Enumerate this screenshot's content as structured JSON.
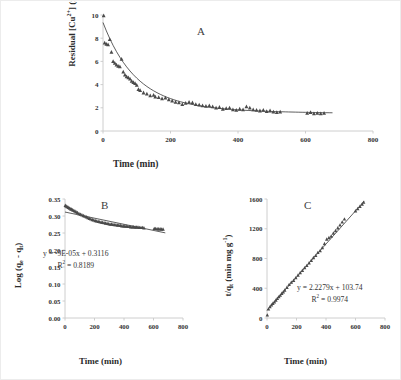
{
  "figure": {
    "background": "#ffffff",
    "axis_color": "#c8c8c8",
    "tick_label_color": "#333333",
    "marker_color": "#4a4a4a",
    "trend_color": "#1a1a1a"
  },
  "panels": [
    {
      "id": "A",
      "letter": "A",
      "xlabel": "Time (min)",
      "ylabel_parts": {
        "pre": "Residual [Cu",
        "sup1": "2+",
        "mid": "] (mg L",
        "sup2": "-1",
        "post": ")"
      },
      "ylabel_plain": "Residual [Cu2+] (mg L-1)",
      "xticks": [
        "0",
        "200",
        "400",
        "600",
        "800"
      ],
      "yticks": [
        "0",
        "2",
        "4",
        "6",
        "8",
        "10"
      ]
    },
    {
      "id": "B",
      "letter": "B",
      "xlabel": "Time (min)",
      "ylabel_parts": {
        "pre": "Log (q",
        "sub1": "e",
        "mid": " - q",
        "sub2": "t",
        "post": ")"
      },
      "ylabel_plain": "Log (qe - qt)",
      "xticks": [
        "0",
        "200",
        "400",
        "600",
        "800"
      ],
      "yticks": [
        "0.00",
        "0.05",
        "0.10",
        "0.15",
        "0.20",
        "0.25",
        "0.30",
        "0.35"
      ],
      "equation": "y = -9E-05x + 0.3116",
      "r_squared_pre": "R",
      "r_squared_sup": "2",
      "r_squared_post": " = 0.8189"
    },
    {
      "id": "C",
      "letter": "C",
      "xlabel": "Time (min)",
      "ylabel_parts": {
        "pre": "t/q",
        "sub1": "t",
        "mid": " (min mg g",
        "sup2": "-1",
        "post": ")"
      },
      "ylabel_plain": "t/qt (min mg g-1)",
      "xticks": [
        "0",
        "200",
        "400",
        "600",
        "800"
      ],
      "yticks": [
        "0",
        "400",
        "800",
        "1200",
        "1600"
      ],
      "equation": "y = 2.2279x + 103.74",
      "r_squared_pre": "R",
      "r_squared_sup": "2",
      "r_squared_post": " = 0.9974"
    }
  ],
  "chart_data": [
    {
      "type": "scatter",
      "panel": "A",
      "title": "A",
      "xlabel": "Time (min)",
      "ylabel": "Residual [Cu2+] (mg L-1)",
      "xlim": [
        0,
        800
      ],
      "ylim": [
        0,
        10
      ],
      "xticks": [
        0,
        200,
        400,
        600,
        800
      ],
      "yticks": [
        0,
        2,
        4,
        6,
        8,
        10
      ],
      "grid": false,
      "legend": "none",
      "marker": "triangle",
      "x": [
        2,
        5,
        10,
        15,
        20,
        25,
        30,
        35,
        40,
        45,
        50,
        55,
        60,
        65,
        70,
        75,
        80,
        85,
        90,
        95,
        100,
        105,
        110,
        120,
        130,
        140,
        150,
        155,
        165,
        175,
        185,
        195,
        205,
        215,
        225,
        235,
        245,
        255,
        265,
        275,
        285,
        295,
        305,
        315,
        325,
        335,
        345,
        355,
        365,
        375,
        385,
        395,
        405,
        415,
        425,
        435,
        445,
        455,
        465,
        475,
        485,
        495,
        505,
        515,
        525,
        605,
        615,
        625,
        635,
        645,
        655
      ],
      "y": [
        9.95,
        7.6,
        7.5,
        7.45,
        7.9,
        6.8,
        6.0,
        5.85,
        5.7,
        5.6,
        5.55,
        6.2,
        5.1,
        4.85,
        4.7,
        4.6,
        4.5,
        4.3,
        4.2,
        4.1,
        3.95,
        3.6,
        3.5,
        3.3,
        3.2,
        3.05,
        3.1,
        2.95,
        2.9,
        2.8,
        2.85,
        2.7,
        2.6,
        2.5,
        2.45,
        2.3,
        2.4,
        2.5,
        2.45,
        2.3,
        2.25,
        2.2,
        2.15,
        2.2,
        2.1,
        2.0,
        2.05,
        1.9,
        1.95,
        2.0,
        1.85,
        1.8,
        1.9,
        1.85,
        2.1,
        2.0,
        1.85,
        1.8,
        1.75,
        1.8,
        1.7,
        1.75,
        1.65,
        1.6,
        1.65,
        1.55,
        1.6,
        1.5,
        1.55,
        1.5,
        1.55
      ]
    },
    {
      "type": "scatter",
      "panel": "B",
      "title": "B",
      "xlabel": "Time (min)",
      "ylabel": "Log (qe - qt)",
      "xlim": [
        0,
        800
      ],
      "ylim": [
        0.0,
        0.35
      ],
      "xticks": [
        0,
        200,
        400,
        600,
        800
      ],
      "yticks": [
        0.0,
        0.05,
        0.1,
        0.15,
        0.2,
        0.25,
        0.3,
        0.35
      ],
      "grid": false,
      "legend": "none",
      "marker": "triangle",
      "annotations": [
        "y = -9E-05x + 0.3116",
        "R2 = 0.8189"
      ],
      "fit": {
        "slope": -9e-05,
        "intercept": 0.3116,
        "r_squared": 0.8189,
        "x_range": [
          0,
          680
        ]
      },
      "x": [
        2,
        8,
        15,
        22,
        30,
        38,
        45,
        52,
        60,
        68,
        75,
        85,
        95,
        105,
        115,
        125,
        135,
        145,
        155,
        165,
        175,
        185,
        195,
        205,
        215,
        225,
        235,
        245,
        255,
        265,
        275,
        285,
        295,
        305,
        315,
        325,
        335,
        345,
        355,
        365,
        375,
        385,
        395,
        405,
        415,
        425,
        435,
        445,
        455,
        465,
        475,
        485,
        495,
        505,
        515,
        525,
        535,
        605,
        615,
        625,
        635,
        645,
        655,
        665
      ],
      "y": [
        0.331,
        0.329,
        0.327,
        0.325,
        0.323,
        0.321,
        0.32,
        0.318,
        0.316,
        0.314,
        0.312,
        0.31,
        0.307,
        0.305,
        0.303,
        0.301,
        0.299,
        0.297,
        0.295,
        0.293,
        0.291,
        0.289,
        0.288,
        0.286,
        0.285,
        0.284,
        0.283,
        0.282,
        0.281,
        0.28,
        0.279,
        0.278,
        0.277,
        0.276,
        0.276,
        0.275,
        0.274,
        0.274,
        0.273,
        0.273,
        0.272,
        0.271,
        0.271,
        0.27,
        0.27,
        0.269,
        0.269,
        0.268,
        0.268,
        0.268,
        0.267,
        0.267,
        0.267,
        0.266,
        0.266,
        0.266,
        0.265,
        0.263,
        0.263,
        0.262,
        0.262,
        0.262,
        0.261,
        0.261
      ]
    },
    {
      "type": "scatter",
      "panel": "C",
      "title": "C",
      "xlabel": "Time (min)",
      "ylabel": "t/qt (min mg g-1)",
      "xlim": [
        0,
        800
      ],
      "ylim": [
        0,
        1600
      ],
      "xticks": [
        0,
        200,
        400,
        600,
        800
      ],
      "yticks": [
        0,
        400,
        800,
        1200,
        1600
      ],
      "grid": false,
      "legend": "none",
      "marker": "triangle",
      "annotations": [
        "y = 2.2279x + 103.74",
        "R2 = 0.9974"
      ],
      "fit": {
        "slope": 2.2279,
        "intercept": 103.74,
        "r_squared": 0.9974,
        "x_range": [
          0,
          660
        ]
      },
      "x": [
        2,
        10,
        20,
        30,
        40,
        50,
        60,
        70,
        80,
        90,
        100,
        110,
        120,
        135,
        150,
        165,
        180,
        195,
        210,
        225,
        240,
        255,
        270,
        285,
        300,
        315,
        330,
        345,
        360,
        375,
        390,
        405,
        420,
        435,
        450,
        465,
        480,
        495,
        510,
        525,
        600,
        615,
        630,
        645,
        655
      ],
      "y": [
        40,
        120,
        150,
        175,
        195,
        215,
        240,
        262,
        285,
        305,
        330,
        350,
        375,
        410,
        450,
        480,
        505,
        540,
        575,
        610,
        640,
        675,
        705,
        740,
        775,
        810,
        840,
        880,
        905,
        945,
        1000,
        1060,
        1080,
        1100,
        1140,
        1175,
        1210,
        1250,
        1290,
        1330,
        1440,
        1470,
        1500,
        1530,
        1555
      ]
    }
  ]
}
